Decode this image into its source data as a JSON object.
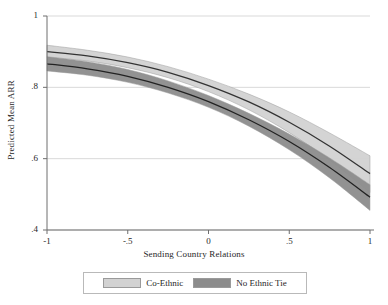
{
  "chart_data": {
    "type": "area",
    "title": "",
    "xlabel": "Sending Country Relations",
    "ylabel": "Predicted Mean ARR",
    "xlim": [
      -1,
      1
    ],
    "ylim": [
      0.4,
      1
    ],
    "xticks": [
      "-1",
      "-.5",
      "0",
      ".5",
      "1"
    ],
    "xtick_values": [
      -1,
      -0.5,
      0,
      0.5,
      1
    ],
    "yticks": [
      "1",
      ".8",
      ".6",
      ".4"
    ],
    "ytick_values": [
      1,
      0.8,
      0.6,
      0.4
    ],
    "grid": "horizontal",
    "legend_position": "bottom",
    "x": [
      -1,
      -0.75,
      -0.5,
      -0.25,
      0,
      0.25,
      0.5,
      0.75,
      1
    ],
    "series": [
      {
        "name": "Co-Ethnic",
        "color": "#d2d2d2",
        "line_color": "#333333",
        "values": [
          0.9,
          0.888,
          0.869,
          0.842,
          0.805,
          0.759,
          0.702,
          0.635,
          0.558
        ],
        "ci_lower": [
          0.884,
          0.874,
          0.855,
          0.827,
          0.788,
          0.737,
          0.673,
          0.596,
          0.505
        ],
        "ci_upper": [
          0.918,
          0.904,
          0.885,
          0.858,
          0.823,
          0.781,
          0.731,
          0.672,
          0.608
        ]
      },
      {
        "name": "No Ethnic Tie",
        "color": "#8c8c8c",
        "line_color": "#222222",
        "values": [
          0.866,
          0.852,
          0.831,
          0.8,
          0.76,
          0.709,
          0.648,
          0.575,
          0.492
        ],
        "ci_lower": [
          0.846,
          0.834,
          0.814,
          0.784,
          0.744,
          0.691,
          0.625,
          0.546,
          0.455
        ],
        "ci_upper": [
          0.886,
          0.872,
          0.85,
          0.818,
          0.777,
          0.727,
          0.669,
          0.602,
          0.527
        ]
      }
    ]
  },
  "legend": {
    "entries": [
      {
        "label": "Co-Ethnic"
      },
      {
        "label": "No Ethnic Tie"
      }
    ]
  },
  "colors": {
    "band_light": "#d2d2d2",
    "band_dark": "#8c8c8c",
    "line_dark": "#2a2a2a",
    "grid": "#c8c8c8",
    "axis": "#6e6e6e",
    "legend_border": "#b9b9b9"
  }
}
